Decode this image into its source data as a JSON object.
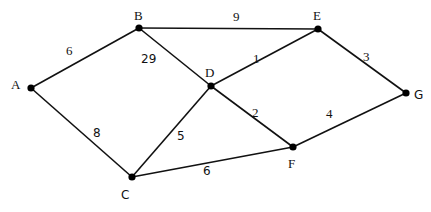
{
  "diagram": {
    "type": "weighted-undirected-graph",
    "nodes": [
      {
        "id": "A",
        "label": "A",
        "x": 31,
        "y": 88,
        "label_x": 13,
        "label_y": 89
      },
      {
        "id": "B",
        "label": "B",
        "x": 139,
        "y": 28,
        "label_x": 134,
        "label_y": 20
      },
      {
        "id": "C",
        "label": "C",
        "x": 132,
        "y": 177,
        "label_x": 122,
        "label_y": 198
      },
      {
        "id": "D",
        "label": "D",
        "x": 211,
        "y": 86,
        "label_x": 205,
        "label_y": 76
      },
      {
        "id": "E",
        "label": "E",
        "x": 318,
        "y": 29,
        "label_x": 313,
        "label_y": 20
      },
      {
        "id": "F",
        "label": "F",
        "x": 293,
        "y": 147,
        "label_x": 288,
        "label_y": 167
      },
      {
        "id": "G",
        "label": "G",
        "x": 406,
        "y": 93,
        "label_x": 415,
        "label_y": 99
      }
    ],
    "edges": [
      {
        "from": "A",
        "to": "B",
        "weight": "6",
        "label_x": 67,
        "label_y": 54
      },
      {
        "from": "A",
        "to": "C",
        "weight": "8",
        "label_x": 93,
        "label_y": 136
      },
      {
        "from": "B",
        "to": "E",
        "weight": "9",
        "label_x": 233,
        "label_y": 21
      },
      {
        "from": "B",
        "to": "D",
        "weight": "29",
        "label_x": 143,
        "label_y": 62
      },
      {
        "from": "D",
        "to": "E",
        "weight": "1",
        "label_x": 251,
        "label_y": 63
      },
      {
        "from": "D",
        "to": "C",
        "weight": "5",
        "label_x": 177,
        "label_y": 139
      },
      {
        "from": "D",
        "to": "F",
        "weight": "2",
        "label_x": 252,
        "label_y": 116
      },
      {
        "from": "E",
        "to": "G",
        "weight": "3",
        "label_x": 364,
        "label_y": 60
      },
      {
        "from": "F",
        "to": "G",
        "weight": "4",
        "label_x": 325,
        "label_y": 117
      },
      {
        "from": "C",
        "to": "F",
        "weight": "6",
        "label_x": 203,
        "label_y": 174
      }
    ]
  },
  "labels": {
    "A": "A",
    "B": "B",
    "C": "C",
    "D": "D",
    "E": "E",
    "F": "F",
    "G": "G",
    "w_AB": "6",
    "w_AC": "8",
    "w_BE": "9",
    "w_BD": "29",
    "w_DE": "1",
    "w_DC": "5",
    "w_DF": "2",
    "w_EG": "3",
    "w_FG": "4",
    "w_CF": "6"
  }
}
